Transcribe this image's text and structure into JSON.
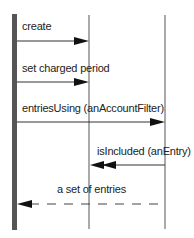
{
  "diagram": {
    "type": "sequence",
    "lifelines": [
      {
        "id": "caller",
        "x": 14,
        "kind": "activation-bar"
      },
      {
        "id": "object",
        "x": 89
      },
      {
        "id": "filter",
        "x": 165
      }
    ],
    "messages": [
      {
        "label": "create",
        "from": "caller",
        "to": "object",
        "style": "solid"
      },
      {
        "label": "set charged period",
        "from": "caller",
        "to": "object",
        "style": "solid"
      },
      {
        "label": "entriesUsing (anAccountFilter)",
        "from": "caller",
        "to": "filter",
        "style": "solid"
      },
      {
        "label": "isIncluded (anEntry)",
        "from": "filter",
        "to": "object",
        "style": "solid",
        "arrow": "double"
      },
      {
        "label": "a set of entries",
        "from": "filter",
        "to": "caller",
        "style": "dashed"
      }
    ],
    "colors": {
      "line": "#555555",
      "bar": "#555555",
      "text": "#222222"
    }
  }
}
